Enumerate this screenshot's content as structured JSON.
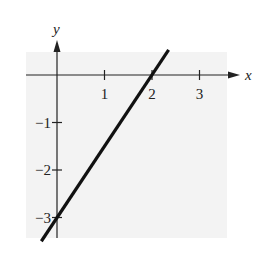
{
  "chart_data": {
    "type": "line",
    "title": "",
    "xlabel": "x",
    "ylabel": "y",
    "xlim": [
      -0.65,
      3.6
    ],
    "ylim": [
      -3.5,
      0.5
    ],
    "x_ticks": [
      1,
      2,
      3
    ],
    "y_ticks": [
      -1,
      -2,
      -3
    ],
    "x_tick_labels": [
      "1",
      "2",
      "3"
    ],
    "y_tick_labels": [
      "−1",
      "−2",
      "−3"
    ],
    "grid": false,
    "legend": null,
    "background_color": "#f3f3f3",
    "line_color": "#111111",
    "series": [
      {
        "name": "y = 1.5x - 3",
        "x": [
          -0.33,
          2.35
        ],
        "y": [
          -3.5,
          0.53
        ]
      }
    ],
    "annotations": []
  }
}
